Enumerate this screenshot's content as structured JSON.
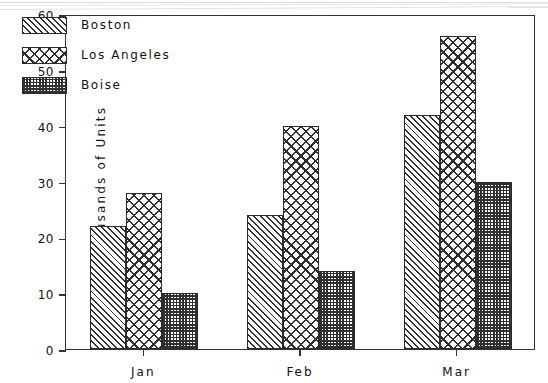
{
  "chart_data": {
    "type": "bar",
    "title": "",
    "subtitle": "",
    "xlabel": "",
    "ylabel": "Thousands of Units",
    "categories": [
      "Jan",
      "Feb",
      "Mar"
    ],
    "series": [
      {
        "name": "Boston",
        "values": [
          22,
          24,
          42
        ],
        "pattern": "diagonal-hatch",
        "color": "#2f2f2f"
      },
      {
        "name": "Los Angeles",
        "values": [
          28,
          40,
          56
        ],
        "pattern": "cross-hatch",
        "color": "#2f2f2f"
      },
      {
        "name": "Boise",
        "values": [
          10,
          14,
          30
        ],
        "pattern": "checker-fine",
        "color": "#2f2f2f"
      }
    ],
    "ylim": [
      0,
      60
    ],
    "yticks": [
      0,
      10,
      20,
      30,
      40,
      50,
      60
    ],
    "ytick_labels": [
      "0",
      "10",
      "20",
      "30",
      "40",
      "50",
      "60"
    ],
    "grid": false,
    "legend_position": "top-left-inside",
    "orientation": "vertical",
    "grouping": "grouped",
    "annotations": []
  },
  "legend": {
    "items": [
      {
        "label": "Boston"
      },
      {
        "label": "Los Angeles"
      },
      {
        "label": "Boise"
      }
    ]
  },
  "axes": {
    "y_title": "Thousands of Units",
    "y_tick_labels": [
      "60",
      "50",
      "40",
      "30",
      "20",
      "10",
      "0"
    ],
    "x_tick_labels": [
      "Jan",
      "Feb",
      "Mar"
    ]
  }
}
